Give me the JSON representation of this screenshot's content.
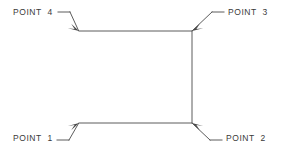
{
  "drawing": {
    "title": "Four corner points of a rectangular outline with leader callouts",
    "background_color": "#ffffff",
    "line_color": "#4a4a4a",
    "text_color": "#3a3a3a",
    "labels": [
      {
        "id": "point-4",
        "text": "POINT  4",
        "position": "top-left"
      },
      {
        "id": "point-3",
        "text": "POINT  3",
        "position": "top-right"
      },
      {
        "id": "point-1",
        "text": "POINT  1",
        "position": "bottom-left"
      },
      {
        "id": "point-2",
        "text": "POINT  2",
        "position": "bottom-right"
      }
    ],
    "shape": {
      "name": "open-rectangle-outline",
      "segments": [
        {
          "name": "top-edge",
          "from": [
            79,
            31
          ],
          "to": [
            192,
            31
          ]
        },
        {
          "name": "right-edge",
          "from": [
            192,
            31
          ],
          "to": [
            192,
            123
          ]
        },
        {
          "name": "bottom-edge",
          "from": [
            79,
            123
          ],
          "to": [
            192,
            123
          ]
        }
      ]
    },
    "leaders": [
      {
        "name": "leader-point-4",
        "stub": [
          [
            58,
            12
          ],
          [
            70,
            12
          ]
        ],
        "diagonal": [
          [
            70,
            12
          ],
          [
            79,
            31
          ]
        ],
        "arrow_at": [
          79,
          31
        ]
      },
      {
        "name": "leader-point-3",
        "stub": [
          [
            212,
            12
          ],
          [
            224,
            12
          ]
        ],
        "diagonal": [
          [
            192,
            31
          ],
          [
            212,
            12
          ]
        ],
        "arrow_at": [
          192,
          31
        ]
      },
      {
        "name": "leader-point-1",
        "stub": [
          [
            57,
            140
          ],
          [
            69,
            140
          ]
        ],
        "diagonal": [
          [
            69,
            140
          ],
          [
            79,
            123
          ]
        ],
        "arrow_at": [
          79,
          123
        ]
      },
      {
        "name": "leader-point-2",
        "stub": [
          [
            210,
            140
          ],
          [
            222,
            140
          ]
        ],
        "diagonal": [
          [
            192,
            123
          ],
          [
            210,
            140
          ]
        ],
        "arrow_at": [
          192,
          123
        ]
      }
    ]
  }
}
